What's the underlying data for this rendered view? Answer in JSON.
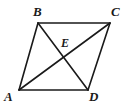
{
  "figure": {
    "type": "geometry-diagram",
    "shape": "parallelogram",
    "background_color": "#ffffff",
    "stroke_color": "#1a1a1a",
    "stroke_width": 1.6,
    "label_color": "#1a1a1a",
    "labels": {
      "B": "B",
      "C": "C",
      "E": "E",
      "A": "A",
      "D": "D"
    },
    "points": {
      "A": {
        "x": 19,
        "y": 90
      },
      "B": {
        "x": 38,
        "y": 23
      },
      "C": {
        "x": 110,
        "y": 23
      },
      "D": {
        "x": 88,
        "y": 90
      },
      "E": {
        "x": 64,
        "y": 56
      }
    },
    "segments": [
      {
        "name": "AB",
        "from": "A",
        "to": "B"
      },
      {
        "name": "BC",
        "from": "B",
        "to": "C"
      },
      {
        "name": "CD",
        "from": "C",
        "to": "D"
      },
      {
        "name": "DA",
        "from": "D",
        "to": "A"
      },
      {
        "name": "AC",
        "from": "A",
        "to": "C"
      },
      {
        "name": "BD",
        "from": "B",
        "to": "D"
      }
    ]
  }
}
